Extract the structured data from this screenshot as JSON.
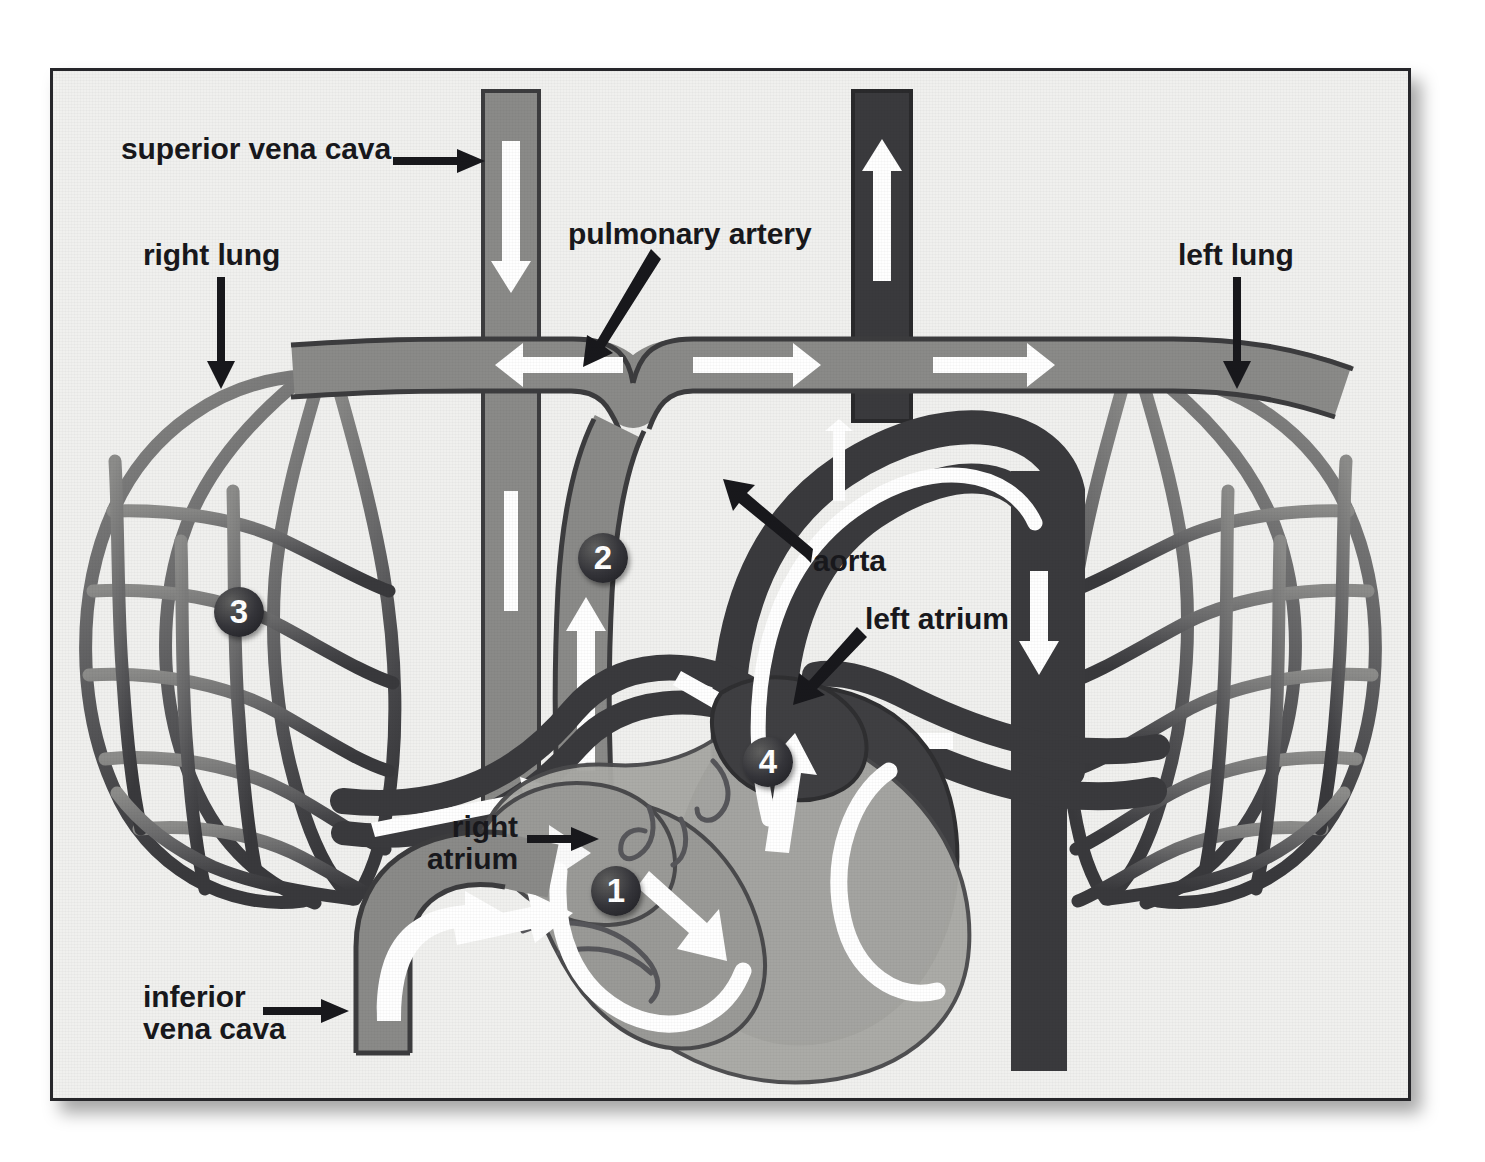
{
  "diagram": {
    "frame": {
      "background_color": "#f0f0ee",
      "border_color": "#26262a"
    },
    "palette": {
      "deoxygenated_vessel": "#8a8a88",
      "oxygenated_vessel": "#3a3a3d",
      "right_heart_chamber": "#9a9a97",
      "left_heart_chamber": "#3f3f42",
      "heart_wall": "#a9a9a5",
      "flow_arrow": "#ffffff",
      "outline": "#3c3c3e",
      "label_text": "#18181c",
      "marker_fill": "#2a2a2e",
      "marker_text": "#ffffff"
    },
    "labels": [
      {
        "id": "superior-vena-cava",
        "text": "superior vena cava",
        "pointer": "arrow-right"
      },
      {
        "id": "right-lung",
        "text": "right lung",
        "pointer": "arrow-down"
      },
      {
        "id": "pulmonary-artery",
        "text": "pulmonary artery",
        "pointer": "arrow-down-left"
      },
      {
        "id": "left-lung",
        "text": "left lung",
        "pointer": "arrow-down"
      },
      {
        "id": "aorta",
        "text": "aorta",
        "pointer": "arrow-up-left"
      },
      {
        "id": "left-atrium",
        "text": "left atrium",
        "pointer": "arrow-down-left"
      },
      {
        "id": "right-atrium",
        "text": "right\natrium",
        "pointer": "arrow-right"
      },
      {
        "id": "inferior-vena-cava",
        "text": "inferior\nvena cava",
        "pointer": "arrow-right"
      }
    ],
    "markers": [
      {
        "number": "1",
        "meaning": "right atrium / right side of heart"
      },
      {
        "number": "2",
        "meaning": "pulmonary artery trunk"
      },
      {
        "number": "3",
        "meaning": "lung capillary bed"
      },
      {
        "number": "4",
        "meaning": "left atrium"
      }
    ],
    "flow_arrows": [
      {
        "id": "svc-down",
        "direction": "down",
        "blood": "deoxygenated"
      },
      {
        "id": "ivc-up",
        "direction": "up",
        "blood": "deoxygenated"
      },
      {
        "id": "pa-trunk-up",
        "direction": "up",
        "blood": "deoxygenated"
      },
      {
        "id": "pa-branch-left",
        "direction": "left",
        "blood": "deoxygenated"
      },
      {
        "id": "pa-branch-right",
        "direction": "right",
        "blood": "deoxygenated"
      },
      {
        "id": "pa-to-left-lung",
        "direction": "right",
        "blood": "deoxygenated"
      },
      {
        "id": "pulm-vein-right",
        "direction": "up-right",
        "blood": "oxygenated"
      },
      {
        "id": "pulm-vein-to-la",
        "direction": "down-right",
        "blood": "oxygenated"
      },
      {
        "id": "pulm-vein-left-to-la",
        "direction": "left",
        "blood": "oxygenated"
      },
      {
        "id": "aorta-ascending-up",
        "direction": "up",
        "blood": "oxygenated"
      },
      {
        "id": "aorta-descending-down",
        "direction": "down",
        "blood": "oxygenated"
      },
      {
        "id": "ra-to-rv",
        "direction": "down-right",
        "blood": "deoxygenated"
      },
      {
        "id": "lv-to-aorta",
        "direction": "up",
        "blood": "oxygenated"
      }
    ]
  }
}
